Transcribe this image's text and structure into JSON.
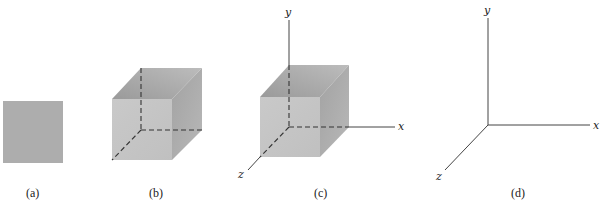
{
  "figure": {
    "panels": [
      {
        "id": "a",
        "caption": "(a)",
        "description": "filled square"
      },
      {
        "id": "b",
        "caption": "(b)",
        "description": "cube with hidden edges dashed"
      },
      {
        "id": "c",
        "caption": "(c)",
        "description": "cube placed at origin of 3D axes"
      },
      {
        "id": "d",
        "caption": "(d)",
        "description": "3D coordinate axes"
      }
    ],
    "axes": {
      "x_label": "x",
      "y_label": "y",
      "z_label": "z"
    },
    "colors": {
      "background": "#ffffff",
      "square_fill": "#adadad",
      "front_face": "#c6c6c6",
      "top_face_dark": "#9a9a9a",
      "top_face_light": "#b8b8b8",
      "side_face_dark": "#9c9c9c",
      "side_face_light": "#b4b4b4",
      "axis_line": "#444444",
      "dashed_edge": "#333333"
    }
  }
}
